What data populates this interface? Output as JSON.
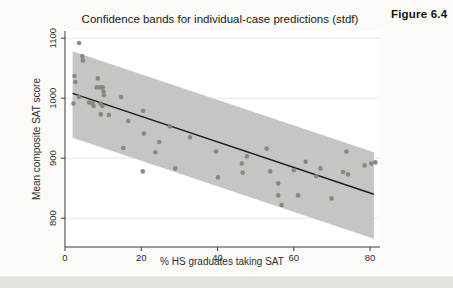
{
  "figure_label": "Figure 6.4",
  "chart_data": {
    "type": "scatter",
    "title": "Confidence bands for individual-case predictions (stdf)",
    "xlabel": "% HS graduates taking SAT",
    "ylabel": "Mean composite SAT score",
    "xlim": [
      0,
      82.6
    ],
    "ylim": [
      752,
      1112
    ],
    "x_ticks": [
      0,
      20,
      40,
      60,
      80
    ],
    "y_ticks": [
      800,
      900,
      1000,
      1100
    ],
    "grid": "horizontal-light",
    "legend": "none",
    "regression": {
      "intercept": 1012.4,
      "slope": -2.13,
      "x_start": 2,
      "x_end": 81
    },
    "band": {
      "x_start": 2,
      "x_end": 81,
      "upper_offset": 70,
      "lower_offset": 74
    },
    "points": [
      [
        3.7,
        1092
      ],
      [
        4.5,
        1070
      ],
      [
        4.7,
        1063
      ],
      [
        2.5,
        1037
      ],
      [
        2.7,
        1027
      ],
      [
        8.6,
        1033
      ],
      [
        8.3,
        1018
      ],
      [
        9.2,
        1018
      ],
      [
        9.9,
        1018
      ],
      [
        10.1,
        1011
      ],
      [
        10.2,
        1005
      ],
      [
        3.7,
        1002
      ],
      [
        2.2,
        991
      ],
      [
        6.3,
        993
      ],
      [
        7.2,
        991
      ],
      [
        7.5,
        987
      ],
      [
        9.3,
        991
      ],
      [
        9.8,
        987
      ],
      [
        9.4,
        973
      ],
      [
        11.5,
        972
      ],
      [
        14.7,
        1002
      ],
      [
        20.5,
        979
      ],
      [
        16.6,
        962
      ],
      [
        27.5,
        953
      ],
      [
        20.7,
        941
      ],
      [
        24.7,
        927
      ],
      [
        23.7,
        910
      ],
      [
        15.3,
        917
      ],
      [
        28.9,
        883
      ],
      [
        20.4,
        878
      ],
      [
        32.8,
        935
      ],
      [
        39.6,
        911
      ],
      [
        47.7,
        903
      ],
      [
        52.9,
        916
      ],
      [
        46.4,
        891
      ],
      [
        46.6,
        876
      ],
      [
        60.0,
        880
      ],
      [
        63.1,
        894
      ],
      [
        40.1,
        868
      ],
      [
        53.8,
        878
      ],
      [
        55.9,
        858
      ],
      [
        55.9,
        838
      ],
      [
        56.8,
        822
      ],
      [
        61.1,
        838
      ],
      [
        69.9,
        833
      ],
      [
        67.0,
        883
      ],
      [
        65.9,
        870
      ],
      [
        72.9,
        877
      ],
      [
        74.2,
        873
      ],
      [
        73.8,
        911
      ],
      [
        78.6,
        888
      ],
      [
        80.3,
        891
      ],
      [
        81.4,
        893
      ]
    ],
    "colors": {
      "band": "#c7c5c1",
      "point": "#86847f",
      "line": "#1c1c1c",
      "axis": "#3a3a3a",
      "grid": "#eae8e2",
      "tick_text": "#2e2e2e"
    }
  }
}
